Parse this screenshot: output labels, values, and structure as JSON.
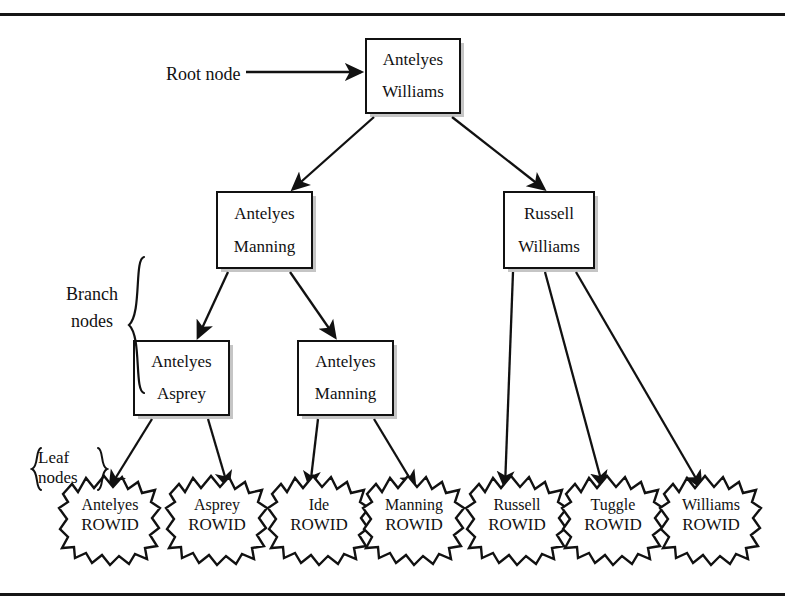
{
  "figure": {
    "ink_color": "#111111",
    "paper_color": "#ffffff"
  },
  "annotations": {
    "root_label": "Root node",
    "branch_label_line1": "Branch",
    "branch_label_line2": "nodes",
    "leaf_label_line1": "Leaf",
    "leaf_label_line2": "nodes"
  },
  "tree": {
    "root": {
      "key1": "Antelyes",
      "key2": "Williams"
    },
    "branch_upper": [
      {
        "key1": "Antelyes",
        "key2": "Manning"
      },
      {
        "key1": "Russell",
        "key2": "Williams"
      }
    ],
    "branch_lower": [
      {
        "key1": "Antelyes",
        "key2": "Asprey"
      },
      {
        "key1": "Antelyes",
        "key2": "Manning"
      }
    ],
    "leaves": [
      {
        "name": "Antelyes",
        "rowid": "ROWID"
      },
      {
        "name": "Asprey",
        "rowid": "ROWID"
      },
      {
        "name": "Ide",
        "rowid": "ROWID"
      },
      {
        "name": "Manning",
        "rowid": "ROWID"
      },
      {
        "name": "Russell",
        "rowid": "ROWID"
      },
      {
        "name": "Tuggle",
        "rowid": "ROWID"
      },
      {
        "name": "Williams",
        "rowid": "ROWID"
      }
    ]
  }
}
